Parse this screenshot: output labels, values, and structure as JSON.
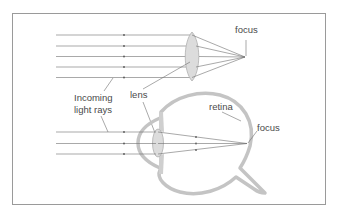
{
  "labels": {
    "focus_top": "focus",
    "incoming_line1": "Incoming",
    "incoming_line2": "light rays",
    "lens": "lens",
    "retina": "retina",
    "focus_eye": "focus"
  },
  "colors": {
    "frame": "#9a9a9a",
    "ray": "#6e6e6e",
    "eye_outline": "#c4c4c4",
    "lens_fill": "#dcdcdc",
    "lens_stroke": "#b0b0b0",
    "text": "#4a4a4a",
    "background": "#ffffff"
  }
}
